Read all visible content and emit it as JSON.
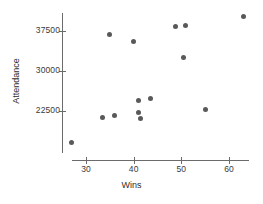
{
  "chart_data": {
    "type": "scatter",
    "title": "",
    "xlabel": "Wins",
    "ylabel": "Attendance",
    "xlim": [
      25,
      65
    ],
    "ylim": [
      15000,
      41500
    ],
    "grid": false,
    "legend": null,
    "xticks": [
      30,
      40,
      50,
      60
    ],
    "xtick_labels": [
      "30",
      "40",
      "50",
      "60"
    ],
    "yticks": [
      22500,
      30000,
      37500
    ],
    "ytick_labels": [
      "22500",
      "30000",
      "37500"
    ],
    "marker_color": "#595959",
    "axis_color": "#6b6b6b",
    "points": [
      {
        "x": 27.0,
        "y": 16600
      },
      {
        "x": 33.5,
        "y": 21200
      },
      {
        "x": 35.0,
        "y": 36800
      },
      {
        "x": 36.0,
        "y": 21750
      },
      {
        "x": 40.0,
        "y": 35500
      },
      {
        "x": 41.0,
        "y": 24500
      },
      {
        "x": 41.0,
        "y": 22250
      },
      {
        "x": 41.5,
        "y": 21100
      },
      {
        "x": 43.5,
        "y": 24900
      },
      {
        "x": 48.7,
        "y": 38300
      },
      {
        "x": 50.8,
        "y": 38500
      },
      {
        "x": 50.5,
        "y": 32500
      },
      {
        "x": 55.0,
        "y": 22700
      },
      {
        "x": 63.0,
        "y": 40300
      }
    ]
  }
}
